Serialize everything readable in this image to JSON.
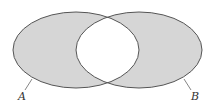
{
  "diagram": {
    "type": "venn",
    "sets": [
      {
        "name": "A",
        "label": "A",
        "cx": 76,
        "cy": 50,
        "rx": 63,
        "ry": 38
      },
      {
        "name": "B",
        "label": "B",
        "cx": 139,
        "cy": 50,
        "rx": 63,
        "ry": 38
      }
    ],
    "colors": {
      "fill": "#d6d6d6",
      "stroke": "#555555",
      "intersection": "#ffffff",
      "background": "#ffffff"
    }
  }
}
